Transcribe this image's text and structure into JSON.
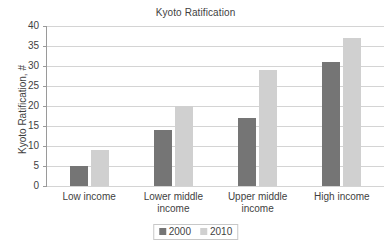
{
  "chart_data": {
    "type": "bar",
    "title": "Kyoto Ratification",
    "xlabel": "",
    "ylabel": "Kyoto Ratification, #",
    "categories": [
      "Low income",
      "Lower middle income",
      "Upper middle income",
      "High income"
    ],
    "series": [
      {
        "name": "2000",
        "color": "#757575",
        "values": [
          5,
          14,
          17,
          31
        ]
      },
      {
        "name": "2010",
        "color": "#d0d0d0",
        "values": [
          9,
          20,
          29,
          37
        ]
      }
    ],
    "ylim": [
      0,
      40
    ],
    "ytick_labels": [
      "40",
      "35",
      "30",
      "25",
      "20",
      "15",
      "10",
      "5",
      "0"
    ],
    "ytick_values": [
      40,
      35,
      30,
      25,
      20,
      15,
      10,
      5,
      0
    ],
    "grid": true,
    "legend_position": "bottom"
  }
}
